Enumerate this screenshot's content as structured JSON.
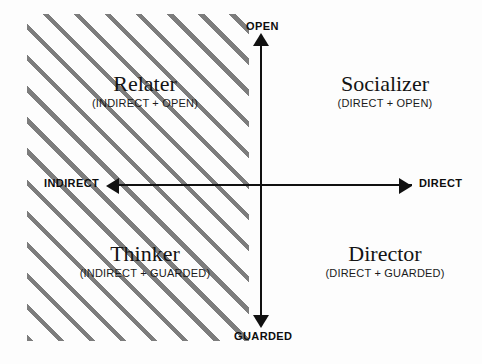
{
  "diagram": {
    "type": "quadrant-matrix",
    "background_color": "#fdfdfd",
    "axis_color": "#111111",
    "hatch_color": "#7d7d7d",
    "axes": {
      "vertical": {
        "top_label": "OPEN",
        "bottom_label": "GUARDED"
      },
      "horizontal": {
        "left_label": "INDIRECT",
        "right_label": "DIRECT"
      }
    },
    "quadrants": [
      {
        "id": "relater",
        "position": "top-left",
        "title": "Relater",
        "subtitle": "(INDIRECT + OPEN)",
        "shaded": true
      },
      {
        "id": "socializer",
        "position": "top-right",
        "title": "Socializer",
        "subtitle": "(DIRECT + OPEN)",
        "shaded": false
      },
      {
        "id": "thinker",
        "position": "bottom-left",
        "title": "Thinker",
        "subtitle": "(INDIRECT + GUARDED)",
        "shaded": true
      },
      {
        "id": "director",
        "position": "bottom-right",
        "title": "Director",
        "subtitle": "(DIRECT + GUARDED)",
        "shaded": false
      }
    ],
    "icons": {
      "arrow_up": "arrow-up-icon",
      "arrow_down": "arrow-down-icon",
      "arrow_left": "arrow-left-icon",
      "arrow_right": "arrow-right-icon"
    }
  }
}
